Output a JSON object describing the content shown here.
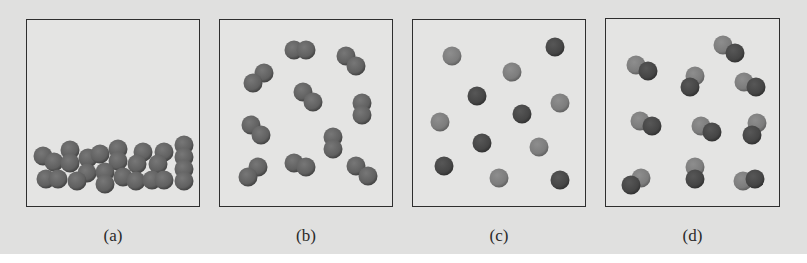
{
  "figure": {
    "colors": {
      "background": "#e0e0df",
      "box_border": "#2e2e2e",
      "atom_light": "#7c7c7c",
      "atom_dark": "#454545"
    },
    "panels": [
      {
        "label": "(a)",
        "box": {
          "x": 26,
          "y": 19,
          "w": 174,
          "h": 188
        },
        "particle_type": "diatomic molecules (packed, condensed)",
        "molecules": [
          [
            [
              16,
              136
            ],
            [
              27,
              142
            ]
          ],
          [
            [
              43,
              130
            ],
            [
              43,
              143
            ]
          ],
          [
            [
              61,
              138
            ],
            [
              73,
              134
            ]
          ],
          [
            [
              91,
              129
            ],
            [
              91,
              141
            ]
          ],
          [
            [
              116,
              132
            ],
            [
              110,
              144
            ]
          ],
          [
            [
              137,
              132
            ],
            [
              131,
              144
            ]
          ],
          [
            [
              157,
              125
            ],
            [
              157,
              137
            ]
          ],
          [
            [
              19,
              159
            ],
            [
              31,
              159
            ]
          ],
          [
            [
              60,
              153
            ],
            [
              50,
              161
            ]
          ],
          [
            [
              78,
              152
            ],
            [
              78,
              164
            ]
          ],
          [
            [
              96,
              157
            ],
            [
              109,
              161
            ]
          ],
          [
            [
              125,
              160
            ],
            [
              137,
              160
            ]
          ],
          [
            [
              157,
              149
            ],
            [
              157,
              161
            ]
          ]
        ]
      },
      {
        "label": "(b)",
        "box": {
          "x": 219,
          "y": 19,
          "w": 174,
          "h": 188
        },
        "particle_type": "diatomic molecules (same element)",
        "molecules": [
          [
            [
              74,
              30
            ],
            [
              86,
              30
            ]
          ],
          [
            [
              126,
              36
            ],
            [
              136,
              46
            ]
          ],
          [
            [
              44,
              53
            ],
            [
              33,
              63
            ]
          ],
          [
            [
              83,
              72
            ],
            [
              93,
              82
            ]
          ],
          [
            [
              142,
              83
            ],
            [
              142,
              95
            ]
          ],
          [
            [
              31,
              105
            ],
            [
              41,
              115
            ]
          ],
          [
            [
              113,
              117
            ],
            [
              113,
              129
            ]
          ],
          [
            [
              38,
              147
            ],
            [
              28,
              157
            ]
          ],
          [
            [
              74,
              143
            ],
            [
              86,
              147
            ]
          ],
          [
            [
              136,
              146
            ],
            [
              148,
              156
            ]
          ]
        ]
      },
      {
        "label": "(c)",
        "box": {
          "x": 412,
          "y": 19,
          "w": 174,
          "h": 188
        },
        "particle_type": "single atoms (mixture of two elements)",
        "atoms": [
          {
            "x": 39,
            "y": 36,
            "tone": "light"
          },
          {
            "x": 142,
            "y": 27,
            "tone": "dark"
          },
          {
            "x": 99,
            "y": 52,
            "tone": "light"
          },
          {
            "x": 64,
            "y": 76,
            "tone": "dark"
          },
          {
            "x": 147,
            "y": 83,
            "tone": "light"
          },
          {
            "x": 109,
            "y": 94,
            "tone": "dark"
          },
          {
            "x": 27,
            "y": 102,
            "tone": "light"
          },
          {
            "x": 69,
            "y": 123,
            "tone": "dark"
          },
          {
            "x": 126,
            "y": 127,
            "tone": "light"
          },
          {
            "x": 31,
            "y": 146,
            "tone": "dark"
          },
          {
            "x": 86,
            "y": 158,
            "tone": "light"
          },
          {
            "x": 147,
            "y": 160,
            "tone": "dark"
          }
        ]
      },
      {
        "label": "(d)",
        "box": {
          "x": 605,
          "y": 18,
          "w": 175,
          "h": 189
        },
        "particle_type": "diatomic molecules (compound of two elements)",
        "molecules": [
          [
            [
              117,
              26
            ],
            [
              129,
              34
            ]
          ],
          [
            [
              30,
              46
            ],
            [
              42,
              52
            ]
          ],
          [
            [
              89,
              57
            ],
            [
              84,
              68
            ]
          ],
          [
            [
              138,
              63
            ],
            [
              150,
              68
            ]
          ],
          [
            [
              34,
              102
            ],
            [
              46,
              107
            ]
          ],
          [
            [
              95,
              107
            ],
            [
              106,
              113
            ]
          ],
          [
            [
              151,
              104
            ],
            [
              146,
              116
            ]
          ],
          [
            [
              35,
              159
            ],
            [
              25,
              166
            ]
          ],
          [
            [
              89,
              148
            ],
            [
              89,
              160
            ]
          ],
          [
            [
              137,
              162
            ],
            [
              149,
              160
            ]
          ]
        ]
      }
    ]
  }
}
